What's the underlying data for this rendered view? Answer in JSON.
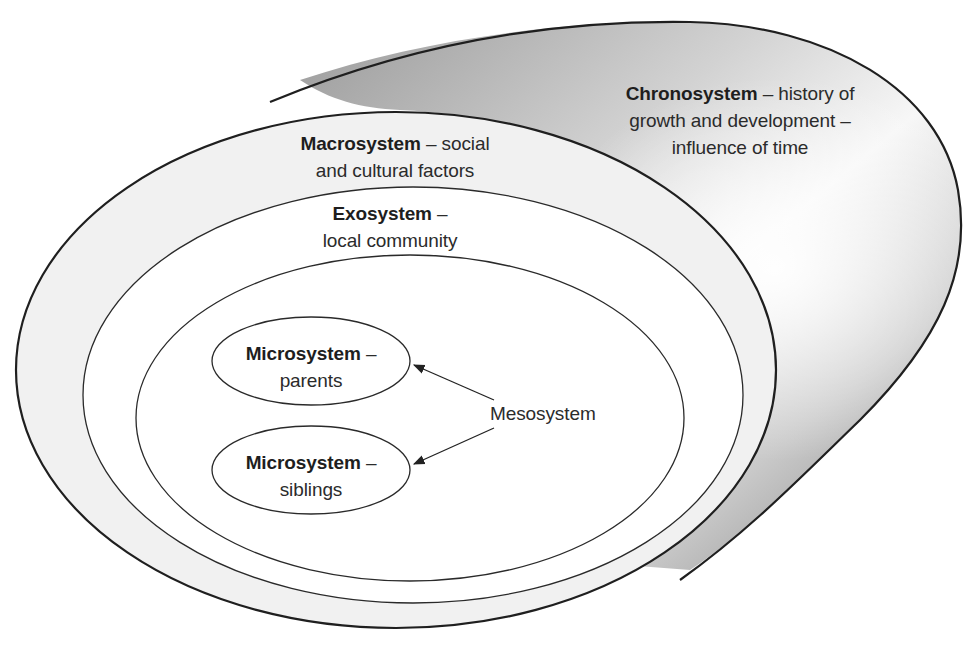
{
  "diagram": {
    "colors": {
      "stroke": "#2a2a2a",
      "macro_band_fill": "#f1f1f1",
      "inner_fill": "#ffffff",
      "cylinder_dark": "#8a8a8a",
      "cylinder_light": "#f4f4f4"
    },
    "chronosystem": {
      "name": "Chronosystem",
      "line1_rest": " – history of",
      "line2": "growth and development –",
      "line3": "influence of time"
    },
    "macrosystem": {
      "name": "Macrosystem",
      "line1_rest": " – social",
      "line2": "and cultural factors"
    },
    "exosystem": {
      "name": "Exosystem",
      "line1_rest": " –",
      "line2": "local community"
    },
    "mesosystem": {
      "name": "Mesosystem"
    },
    "microsystems": [
      {
        "name": "Microsystem",
        "line1_rest": " –",
        "line2": "parents"
      },
      {
        "name": "Microsystem",
        "line1_rest": " –",
        "line2": "siblings"
      }
    ]
  }
}
